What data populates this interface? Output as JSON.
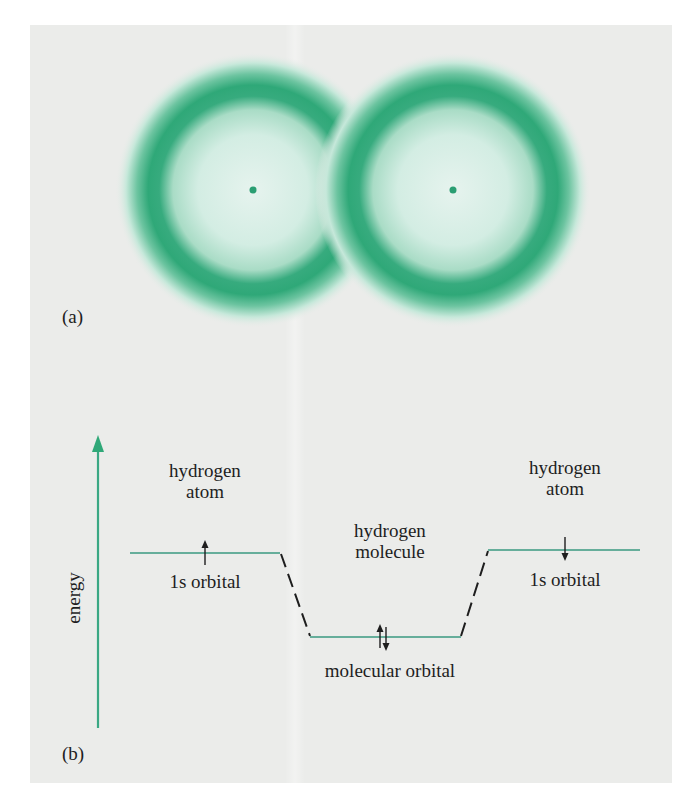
{
  "figure": {
    "panel_a": {
      "label": "(a)",
      "atoms": [
        {
          "name": "left-hydrogen-atom",
          "cx": 253,
          "cy": 190
        },
        {
          "name": "right-hydrogen-atom",
          "cx": 453,
          "cy": 190
        }
      ],
      "orbital_color": "#2fa878"
    },
    "panel_b": {
      "label": "(b)",
      "axis_label": "energy",
      "left_atom": {
        "title_line1": "hydrogen",
        "title_line2": "atom",
        "orbital_label": "1s orbital",
        "electron": "up"
      },
      "right_atom": {
        "title_line1": "hydrogen",
        "title_line2": "atom",
        "orbital_label": "1s orbital",
        "electron": "down"
      },
      "molecule": {
        "title_line1": "hydrogen",
        "title_line2": "molecule",
        "orbital_label": "molecular orbital",
        "electrons": "up-down pair"
      },
      "level_color": "#3a9a80",
      "arrow_color": "#2fa878"
    }
  }
}
